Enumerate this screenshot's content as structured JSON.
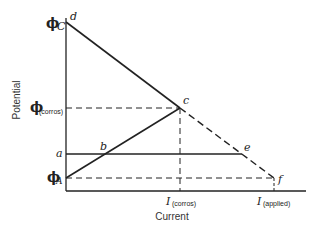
{
  "diagram": {
    "axes": {
      "x_label": "Current",
      "y_label": "Potential"
    },
    "y_labels": {
      "phi_c": {
        "symbol": "ϕ",
        "sub": "C"
      },
      "phi_corros": {
        "symbol": "ϕ",
        "sub": "(corros)"
      },
      "a": "a",
      "phi_a": {
        "symbol": "ϕ",
        "sub": "A"
      }
    },
    "x_labels": {
      "i_corros": {
        "symbol": "I",
        "sub": "(corros)"
      },
      "i_applied": {
        "symbol": "I",
        "sub": "(applied)"
      }
    },
    "points": {
      "d": "d",
      "c": "c",
      "b": "b",
      "e": "e",
      "f": "f"
    }
  }
}
